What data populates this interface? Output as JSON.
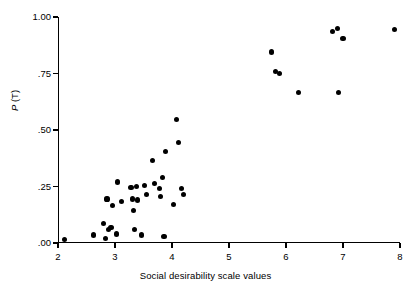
{
  "chart_data": {
    "type": "scatter",
    "title": "",
    "xlabel": "Social desirability scale values",
    "ylabel": "P (T)",
    "ylabel_italic_part": "P",
    "ylabel_rest": " (T)",
    "xlim": [
      2,
      8
    ],
    "ylim": [
      0.0,
      1.0
    ],
    "grid": false,
    "legend": null,
    "xticks": [
      2,
      3,
      4,
      5,
      6,
      7,
      8
    ],
    "xtick_labels": [
      "2",
      "3",
      "4",
      "5",
      "6",
      "7",
      "8"
    ],
    "yticks": [
      0.0,
      0.25,
      0.5,
      0.75,
      1.0
    ],
    "ytick_labels": [
      ".00",
      ".25",
      ".50",
      ".75",
      "1.00"
    ],
    "marker": "filled-circle",
    "marker_color": "#000000",
    "points": [
      {
        "x": 2.12,
        "y": 0.015
      },
      {
        "x": 2.62,
        "y": 0.035
      },
      {
        "x": 2.8,
        "y": 0.085
      },
      {
        "x": 2.84,
        "y": 0.02
      },
      {
        "x": 2.86,
        "y": 0.195
      },
      {
        "x": 2.88,
        "y": 0.06
      },
      {
        "x": 2.93,
        "y": 0.07
      },
      {
        "x": 2.95,
        "y": 0.165
      },
      {
        "x": 3.02,
        "y": 0.04
      },
      {
        "x": 3.05,
        "y": 0.27
      },
      {
        "x": 3.12,
        "y": 0.185
      },
      {
        "x": 3.28,
        "y": 0.245
      },
      {
        "x": 3.3,
        "y": 0.195
      },
      {
        "x": 3.33,
        "y": 0.145
      },
      {
        "x": 3.34,
        "y": 0.06
      },
      {
        "x": 3.38,
        "y": 0.25
      },
      {
        "x": 3.4,
        "y": 0.19
      },
      {
        "x": 3.47,
        "y": 0.035
      },
      {
        "x": 3.52,
        "y": 0.255
      },
      {
        "x": 3.55,
        "y": 0.215
      },
      {
        "x": 3.66,
        "y": 0.365
      },
      {
        "x": 3.7,
        "y": 0.265
      },
      {
        "x": 3.78,
        "y": 0.24
      },
      {
        "x": 3.8,
        "y": 0.205
      },
      {
        "x": 3.84,
        "y": 0.29
      },
      {
        "x": 3.86,
        "y": 0.03
      },
      {
        "x": 3.88,
        "y": 0.405
      },
      {
        "x": 4.02,
        "y": 0.17
      },
      {
        "x": 4.08,
        "y": 0.545
      },
      {
        "x": 4.12,
        "y": 0.445
      },
      {
        "x": 4.16,
        "y": 0.24
      },
      {
        "x": 4.2,
        "y": 0.215
      },
      {
        "x": 5.74,
        "y": 0.845
      },
      {
        "x": 5.82,
        "y": 0.76
      },
      {
        "x": 5.88,
        "y": 0.75
      },
      {
        "x": 6.22,
        "y": 0.665
      },
      {
        "x": 6.82,
        "y": 0.935
      },
      {
        "x": 6.9,
        "y": 0.95
      },
      {
        "x": 6.92,
        "y": 0.665
      },
      {
        "x": 7.0,
        "y": 0.905
      },
      {
        "x": 7.9,
        "y": 0.945
      }
    ]
  }
}
